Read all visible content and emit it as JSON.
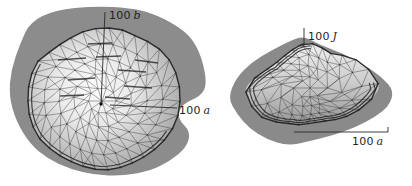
{
  "figure": {
    "background": "#ffffff"
  },
  "chart_data": [
    {
      "type": "surface",
      "title": "",
      "view": "top view of polyhedral mesh surface",
      "labels": {
        "vertical": {
          "scale": "100",
          "symbol": "b"
        },
        "horizontal": {
          "scale": "100",
          "symbol": "a"
        }
      },
      "center": [
        102,
        101
      ],
      "silhouette_radii": [
        78,
        77,
        74,
        71,
        69,
        69,
        69,
        68,
        68,
        70,
        73,
        74,
        74,
        75,
        76,
        71,
        70,
        72,
        73,
        74,
        73,
        77,
        79,
        79
      ],
      "ring_fractions": [
        0.18,
        0.38,
        0.58,
        0.78,
        1.0
      ],
      "ring_counts": [
        10,
        16,
        22,
        28,
        34
      ],
      "blob_outline": [
        [
          30,
          22
        ],
        [
          55,
          10
        ],
        [
          95,
          6
        ],
        [
          130,
          8
        ],
        [
          152,
          13
        ],
        [
          176,
          25
        ],
        [
          192,
          38
        ],
        [
          202,
          58
        ],
        [
          207,
          84
        ],
        [
          201,
          96
        ],
        [
          182,
          104
        ],
        [
          177,
          118
        ],
        [
          191,
          132
        ],
        [
          186,
          148
        ],
        [
          170,
          161
        ],
        [
          150,
          171
        ],
        [
          122,
          176
        ],
        [
          95,
          175
        ],
        [
          70,
          169
        ],
        [
          48,
          159
        ],
        [
          30,
          144
        ],
        [
          16,
          121
        ],
        [
          9,
          96
        ],
        [
          11,
          70
        ],
        [
          20,
          44
        ]
      ],
      "rim": {
        "fracs": [
          0.95
        ],
        "range": [
          25,
          215
        ]
      },
      "accent_segments": [
        [
          58,
          60,
          86,
          58
        ],
        [
          96,
          57,
          121,
          56
        ],
        [
          118,
          70,
          146,
          72
        ],
        [
          68,
          80,
          95,
          78
        ],
        [
          124,
          86,
          152,
          88
        ],
        [
          88,
          44,
          112,
          43
        ],
        [
          135,
          60,
          158,
          63
        ],
        [
          60,
          96,
          84,
          95
        ],
        [
          105,
          97,
          130,
          99
        ]
      ],
      "axis_lines": [
        [
          105,
          12,
          101,
          104
        ],
        [
          110,
          105,
          177,
          108
        ]
      ],
      "origin_dot": [
        101,
        104
      ],
      "gradient": {
        "type": "radial",
        "cx": 0.44,
        "cy": 0.42,
        "r": 0.62
      },
      "colors": {
        "blob": "#8c8c8c",
        "mesh": "#2e2e2e",
        "rim": "#1c1c1c",
        "axis": "#2b2b2b",
        "surface_stops": [
          [
            0,
            "#fcfcfc"
          ],
          [
            0.42,
            "#e9e9e9"
          ],
          [
            0.72,
            "#c6c6c6"
          ],
          [
            1,
            "#a4a4a4"
          ]
        ]
      }
    },
    {
      "type": "surface",
      "title": "",
      "view": "oblique edge-on view of polyhedral mesh surface",
      "labels": {
        "vertical": {
          "scale": "100",
          "symbol": "J"
        },
        "horizontal": {
          "scale": "100",
          "symbol": "a"
        }
      },
      "center": [
        310,
        88
      ],
      "silhouette_radii": [
        70,
        59,
        50,
        43,
        37,
        35,
        35,
        38,
        41,
        48,
        57,
        62,
        65,
        52,
        43,
        41,
        41,
        44,
        45,
        42,
        40,
        46,
        55,
        63
      ],
      "ring_fractions": [
        0.25,
        0.5,
        0.75,
        1.0
      ],
      "ring_counts": [
        8,
        14,
        20,
        26
      ],
      "blob_outline": [
        [
          228,
          98
        ],
        [
          236,
          78
        ],
        [
          252,
          62
        ],
        [
          272,
          50
        ],
        [
          292,
          40
        ],
        [
          304,
          36
        ],
        [
          320,
          45
        ],
        [
          342,
          53
        ],
        [
          364,
          65
        ],
        [
          382,
          77
        ],
        [
          394,
          91
        ],
        [
          389,
          106
        ],
        [
          375,
          117
        ],
        [
          356,
          127
        ],
        [
          334,
          135
        ],
        [
          310,
          141
        ],
        [
          288,
          146
        ],
        [
          266,
          139
        ],
        [
          249,
          128
        ],
        [
          237,
          114
        ]
      ],
      "rim": {
        "fracs": [
          0.88,
          0.94
        ],
        "range": [
          -5,
          272
        ]
      },
      "accent_segments": [],
      "axis_lines": [
        [
          304,
          28,
          304,
          46
        ],
        [
          298,
          46,
          304,
          46
        ],
        [
          294,
          132,
          388,
          132
        ],
        [
          388,
          132,
          388,
          127
        ]
      ],
      "origin_dot": null,
      "gradient": {
        "type": "linear",
        "x1": 0.45,
        "y1": 0,
        "x2": 0.5,
        "y2": 1
      },
      "colors": {
        "blob": "#8a8a8a",
        "mesh": "#2e2e2e",
        "rim": "#1c1c1c",
        "axis": "#2b2b2b",
        "surface_stops": [
          [
            0,
            "#f0f0f0"
          ],
          [
            0.5,
            "#cccccc"
          ],
          [
            1,
            "#969696"
          ]
        ]
      }
    }
  ]
}
